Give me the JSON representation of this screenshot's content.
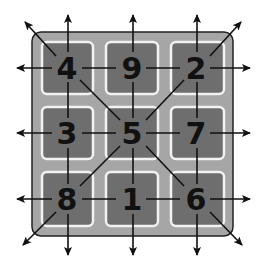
{
  "diagram": {
    "colors": {
      "background": "#ffffff",
      "board": "#a6a6a6",
      "board_border": "#222222",
      "cell": "#6e6e6e",
      "cell_border": "#f2f2f2",
      "line": "#111111",
      "number": "#111111"
    },
    "grid": {
      "rows": [
        [
          "4",
          "9",
          "2"
        ],
        [
          "3",
          "5",
          "7"
        ],
        [
          "8",
          "1",
          "6"
        ]
      ]
    },
    "cells": [
      {
        "id": "r0c0",
        "value": "4"
      },
      {
        "id": "r0c1",
        "value": "9"
      },
      {
        "id": "r0c2",
        "value": "2"
      },
      {
        "id": "r1c0",
        "value": "3"
      },
      {
        "id": "r1c1",
        "value": "5"
      },
      {
        "id": "r1c2",
        "value": "7"
      },
      {
        "id": "r2c0",
        "value": "8"
      },
      {
        "id": "r2c1",
        "value": "1"
      },
      {
        "id": "r2c2",
        "value": "6"
      }
    ]
  }
}
